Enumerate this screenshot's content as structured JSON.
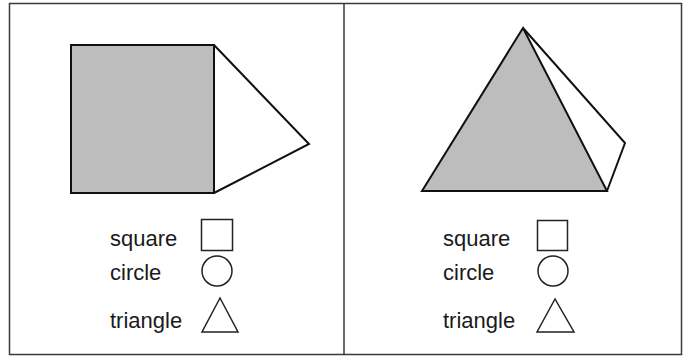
{
  "colors": {
    "shade": "#bdbdbd",
    "stroke": "#111111",
    "frame": "#3a3a3a"
  },
  "panels": [
    {
      "figure": "square-with-triangle",
      "options": [
        {
          "label": "square",
          "icon": "square-icon"
        },
        {
          "label": "circle",
          "icon": "circle-icon"
        },
        {
          "label": "triangle",
          "icon": "triangle-icon"
        }
      ]
    },
    {
      "figure": "pyramid",
      "options": [
        {
          "label": "square",
          "icon": "square-icon"
        },
        {
          "label": "circle",
          "icon": "circle-icon"
        },
        {
          "label": "triangle",
          "icon": "triangle-icon"
        }
      ]
    }
  ]
}
